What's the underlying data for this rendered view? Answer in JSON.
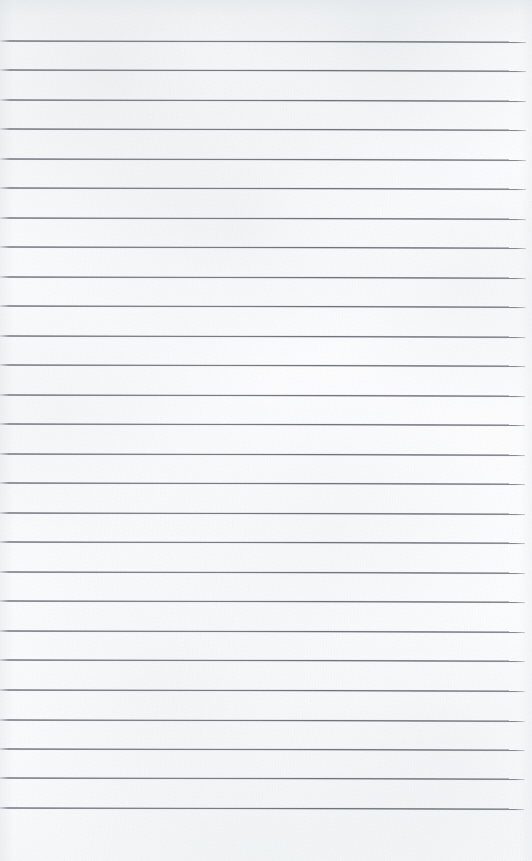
{
  "document": {
    "kind": "scanned-ruled-notebook-page",
    "page_width": 532,
    "page_height": 861,
    "paper_color": "#fafbfb",
    "rule_color": "#62666f",
    "has_text": false,
    "written_content": "",
    "handwriting_lines": []
  },
  "layout": {
    "top_margin_height": 41,
    "bottom_margin_height": 53,
    "left_rule_start_x": 0,
    "rule_end_x": 525,
    "rule_spacing": 29.5,
    "rule_thickness": 2,
    "scan_skew_degrees": 0.13
  },
  "ruled_lines": [
    {
      "index": 1,
      "y": 41,
      "x_start": 0,
      "x_end": 526
    },
    {
      "index": 2,
      "y": 70,
      "x_start": 0,
      "x_end": 526
    },
    {
      "index": 3,
      "y": 100,
      "x_start": 0,
      "x_end": 526
    },
    {
      "index": 4,
      "y": 129,
      "x_start": 0,
      "x_end": 526
    },
    {
      "index": 5,
      "y": 159,
      "x_start": 0,
      "x_end": 526
    },
    {
      "index": 6,
      "y": 188,
      "x_start": 0,
      "x_end": 526
    },
    {
      "index": 7,
      "y": 218,
      "x_start": 0,
      "x_end": 526
    },
    {
      "index": 8,
      "y": 247,
      "x_start": 0,
      "x_end": 526
    },
    {
      "index": 9,
      "y": 277,
      "x_start": 0,
      "x_end": 526
    },
    {
      "index": 10,
      "y": 306,
      "x_start": 0,
      "x_end": 526
    },
    {
      "index": 11,
      "y": 336,
      "x_start": 0,
      "x_end": 526
    },
    {
      "index": 12,
      "y": 365,
      "x_start": 0,
      "x_end": 526
    },
    {
      "index": 13,
      "y": 395,
      "x_start": 0,
      "x_end": 526
    },
    {
      "index": 14,
      "y": 424,
      "x_start": 0,
      "x_end": 526
    },
    {
      "index": 15,
      "y": 454,
      "x_start": 0,
      "x_end": 526
    },
    {
      "index": 16,
      "y": 483,
      "x_start": 0,
      "x_end": 526
    },
    {
      "index": 17,
      "y": 513,
      "x_start": 0,
      "x_end": 526
    },
    {
      "index": 18,
      "y": 542,
      "x_start": 0,
      "x_end": 526
    },
    {
      "index": 19,
      "y": 572,
      "x_start": 0,
      "x_end": 526
    },
    {
      "index": 20,
      "y": 601,
      "x_start": 0,
      "x_end": 526
    },
    {
      "index": 21,
      "y": 631,
      "x_start": 0,
      "x_end": 526
    },
    {
      "index": 22,
      "y": 660,
      "x_start": 0,
      "x_end": 526
    },
    {
      "index": 23,
      "y": 690,
      "x_start": 0,
      "x_end": 526
    },
    {
      "index": 24,
      "y": 720,
      "x_start": 0,
      "x_end": 526
    },
    {
      "index": 25,
      "y": 749,
      "x_start": 0,
      "x_end": 526
    },
    {
      "index": 26,
      "y": 778,
      "x_start": 0,
      "x_end": 526
    },
    {
      "index": 27,
      "y": 808,
      "x_start": 0,
      "x_end": 526
    }
  ]
}
